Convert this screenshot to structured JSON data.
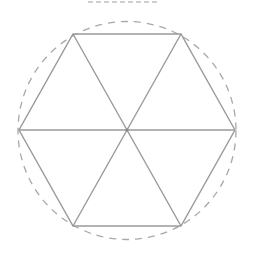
{
  "diagram": {
    "type": "regular hexagon inscribed in circle, divided into 6 equilateral triangles",
    "center": [
      127,
      130
    ],
    "circle": {
      "radius": 109,
      "style": "dashed",
      "color": "#a8a8a8"
    },
    "hexagon": {
      "vertices": [
        [
          235,
          130
        ],
        [
          181,
          34
        ],
        [
          73,
          34
        ],
        [
          19,
          130
        ],
        [
          73,
          226
        ],
        [
          181,
          226
        ]
      ],
      "color": "#9a9a9a"
    },
    "spokes": {
      "count": 6,
      "color": "#9a9a9a"
    },
    "center_dot": {
      "color": "#888888"
    },
    "title_clipped": true
  }
}
